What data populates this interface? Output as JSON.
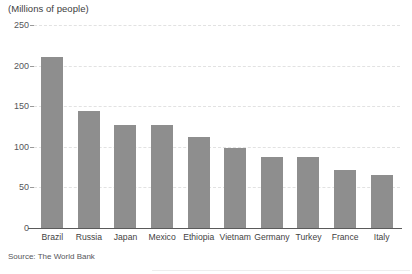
{
  "chart_data": {
    "type": "bar",
    "title": "(Millions of people)",
    "xlabel": "",
    "ylabel": "(Millions of people)",
    "categories": [
      "Brazil",
      "Russia",
      "Japan",
      "Mexico",
      "Ethiopia",
      "Vietnam",
      "Germany",
      "Turkey",
      "France",
      "Italy"
    ],
    "values": [
      210,
      144,
      127,
      127,
      112,
      98,
      87,
      87,
      71,
      65
    ],
    "ylim": [
      0,
      250
    ],
    "yticks": [
      0,
      50,
      100,
      150,
      200,
      250
    ],
    "ytick_labels": [
      "0",
      "50",
      "100",
      "150",
      "200",
      "250"
    ],
    "grid": true,
    "grid_style": "dashed-horizontal",
    "legend": null,
    "bar_color": "#8e8e8e",
    "gridline_color": "#e2e2e2",
    "axis_color": "#5a5a5a",
    "background": "#ffffff"
  },
  "source_note": "Source: The World Bank"
}
